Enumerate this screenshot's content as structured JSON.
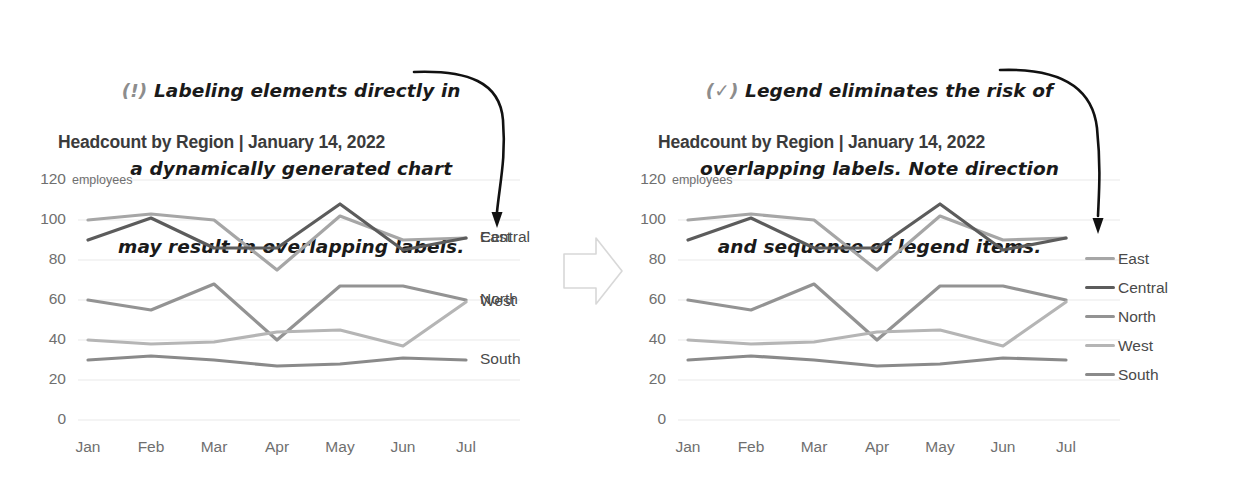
{
  "annotations": {
    "left": {
      "mark": "(!)",
      "lines": [
        "Labeling elements directly in",
        "a dynamically generated chart",
        "may result in overlapping labels."
      ]
    },
    "right": {
      "mark": "(✓)",
      "lines": [
        "Legend eliminates the risk of",
        "overlapping labels. Note direction",
        "and sequence of legend items."
      ]
    }
  },
  "charts": {
    "left": {
      "title": "Headcount by Region | January 14, 2022",
      "label_mode": "direct-labels",
      "direct_labels": [
        {
          "text": "East",
          "series": "East"
        },
        {
          "text": "Central",
          "series": "Central"
        },
        {
          "text": "North",
          "series": "North"
        },
        {
          "text": "West",
          "series": "West"
        },
        {
          "text": "South",
          "series": "South"
        }
      ]
    },
    "right": {
      "title": "Headcount by Region | January 14, 2022",
      "label_mode": "legend",
      "legend_items": [
        "East",
        "Central",
        "North",
        "West",
        "South"
      ]
    }
  },
  "chart_data": {
    "type": "line",
    "title": "Headcount by Region | January 14, 2022",
    "xlabel": "",
    "ylabel": "employees",
    "yunit": "employees",
    "categories": [
      "Jan",
      "Feb",
      "Mar",
      "Apr",
      "May",
      "Jun",
      "Jul"
    ],
    "yticks": [
      0,
      20,
      40,
      60,
      80,
      100,
      120
    ],
    "ylim": [
      0,
      120
    ],
    "grid": true,
    "legend_position": "right",
    "series": [
      {
        "name": "East",
        "values": [
          100,
          103,
          100,
          75,
          102,
          90,
          91
        ],
        "color": "#a6a6a6"
      },
      {
        "name": "Central",
        "values": [
          90,
          101,
          86,
          86,
          108,
          85,
          91
        ],
        "color": "#5c5c5c"
      },
      {
        "name": "North",
        "values": [
          60,
          55,
          68,
          40,
          67,
          67,
          60
        ],
        "color": "#939393"
      },
      {
        "name": "West",
        "values": [
          40,
          38,
          39,
          44,
          45,
          37,
          59
        ],
        "color": "#b5b5b5"
      },
      {
        "name": "South",
        "values": [
          30,
          32,
          30,
          27,
          28,
          31,
          30
        ],
        "color": "#8a8a8a"
      }
    ]
  },
  "colors": {
    "grid": "#e9e9e9",
    "axis_text": "#6f6f6f",
    "title_text": "#3b3b3b",
    "annotation_text": "#1a1a1a",
    "annotation_mark": "#8d8d8d",
    "arrow": "#111111",
    "big_arrow_outline": "#d8d8d8"
  }
}
